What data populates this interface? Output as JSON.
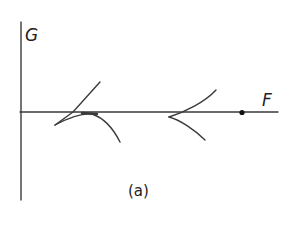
{
  "figure": {
    "axes": {
      "y_label": "G",
      "x_label": "F"
    },
    "caption": "(a)",
    "colors": {
      "stroke": "#3a3a3a",
      "point": "#111111"
    },
    "elements": [
      {
        "type": "cusp",
        "position": "left",
        "description": "cusp near origin side pointing left"
      },
      {
        "type": "cusp",
        "position": "right",
        "description": "cusp on F axis pointing left"
      },
      {
        "type": "point",
        "description": "filled dot on F axis"
      }
    ]
  }
}
